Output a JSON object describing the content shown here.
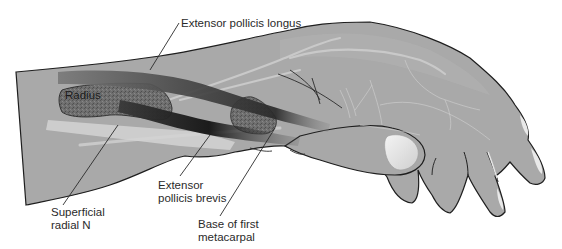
{
  "figure": {
    "colors": {
      "background": "#ffffff",
      "skin": "#a9a9a9",
      "skin_light": "#bcbcbc",
      "outline": "#1e1e1e",
      "bone": "#6b6b6b",
      "tendon_dark": "#1c1c1c",
      "tendon_mid": "#5a5a5a",
      "vein": "#c8c8c8",
      "nerve": "#d6d6d6",
      "nail": "#e8e8e8",
      "label_text": "#2a2a2a"
    },
    "labels": {
      "extensor_pollicis_longus": "Extensor pollicis longus",
      "radius": "Radius",
      "extensor_pollicis_brevis": [
        "Extensor",
        "pollicis brevis"
      ],
      "superficial_radial_n": [
        "Superficial",
        "radial N"
      ],
      "base_of_first_metacarpal": [
        "Base of first",
        "metacarpal"
      ]
    }
  }
}
